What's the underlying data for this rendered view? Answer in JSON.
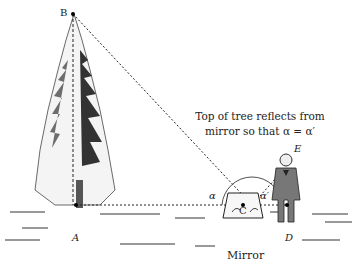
{
  "caption": {
    "line1": "Top of tree reflects from",
    "line2": "mirror so that α = α′"
  },
  "points": {
    "B": "B",
    "A": "A",
    "C": "C",
    "D": "D",
    "E": "E"
  },
  "angles": {
    "alpha": "α",
    "alpha_prime": "α′"
  },
  "mirror_label": "Mirror"
}
